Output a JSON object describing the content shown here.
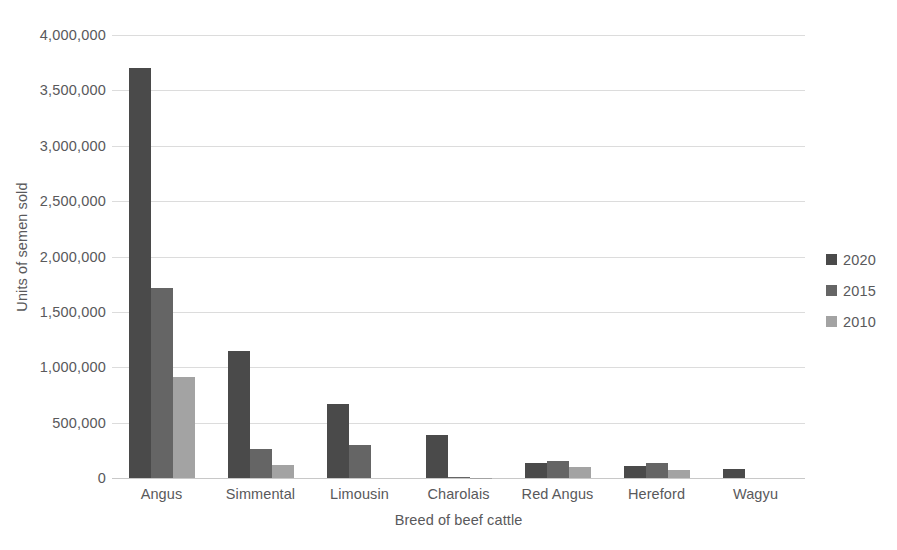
{
  "chart_data": {
    "type": "bar",
    "title": "",
    "xlabel": "Breed of beef cattle",
    "ylabel": "Units of semen sold",
    "categories": [
      "Angus",
      "Simmental",
      "Limousin",
      "Charolais",
      "Red Angus",
      "Hereford",
      "Wagyu"
    ],
    "series": [
      {
        "name": "2020",
        "color": "#4a4a4a",
        "values": [
          3700000,
          1150000,
          665000,
          390000,
          140000,
          110000,
          80000
        ]
      },
      {
        "name": "2015",
        "color": "#656565",
        "values": [
          1720000,
          260000,
          300000,
          12000,
          155000,
          135000,
          0
        ]
      },
      {
        "name": "2010",
        "color": "#a3a3a3",
        "values": [
          910000,
          115000,
          0,
          4000,
          95000,
          75000,
          0
        ]
      }
    ],
    "ylim": [
      0,
      4000000
    ],
    "ytick_step": 500000,
    "ytick_labels": [
      "4,000,000",
      "3,500,000",
      "3,000,000",
      "2,500,000",
      "2,000,000",
      "1,500,000",
      "1,000,000",
      "500,000",
      "0"
    ],
    "ytick_values": [
      4000000,
      3500000,
      3000000,
      2500000,
      2000000,
      1500000,
      1000000,
      500000,
      0
    ],
    "grid": true,
    "grid_axis": "y",
    "legend_position": "right",
    "legend_entries": [
      "2020",
      "2015",
      "2010"
    ],
    "text_color": "#59595b",
    "gridline_color": "#dcdcdc",
    "background": "#ffffff"
  }
}
